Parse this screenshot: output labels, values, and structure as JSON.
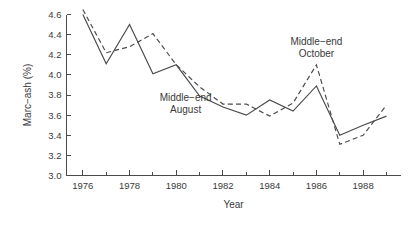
{
  "chart_data": {
    "type": "line",
    "title": "",
    "xlabel": "Year",
    "ylabel": "Marc−ash (%)",
    "xlim": [
      1975.3,
      1989.6
    ],
    "ylim": [
      3.0,
      4.6
    ],
    "grid": false,
    "legend_position": "inline-annotations",
    "x": [
      1976,
      1977,
      1978,
      1979,
      1980,
      1981,
      1982,
      1983,
      1984,
      1985,
      1986,
      1987,
      1988,
      1989
    ],
    "xticks_major": [
      1976,
      1978,
      1980,
      1982,
      1984,
      1986,
      1988
    ],
    "xticks_major_labels": [
      "1976",
      "1978",
      "1980",
      "1982",
      "1984",
      "1986",
      "1988"
    ],
    "xticks_minor": [
      1977,
      1979,
      1981,
      1983,
      1985,
      1987,
      1989
    ],
    "yticks": [
      3.0,
      3.2,
      3.4,
      3.6,
      3.8,
      4.0,
      4.2,
      4.4,
      4.6
    ],
    "ytick_labels": [
      "3.0",
      "3.2",
      "3.4",
      "3.6",
      "3.8",
      "4.0",
      "4.2",
      "4.4",
      "4.6"
    ],
    "series": [
      {
        "name": "Middle−end August",
        "style": "solid",
        "color": "#4a4a4a",
        "label_line1": "Middle−end",
        "label_line2": "August",
        "values": [
          4.6,
          4.11,
          4.5,
          4.01,
          4.1,
          3.79,
          3.68,
          3.6,
          3.75,
          3.64,
          3.89,
          3.4,
          3.5,
          3.59
        ]
      },
      {
        "name": "Middle−end October",
        "style": "dashed",
        "color": "#4a4a4a",
        "label_line1": "Middle−end",
        "label_line2": "October",
        "values": [
          4.65,
          4.22,
          4.28,
          4.41,
          4.1,
          3.88,
          3.71,
          3.71,
          3.59,
          3.72,
          4.1,
          3.31,
          3.4,
          3.7
        ]
      }
    ],
    "annotations": [
      {
        "name": "october-label",
        "line1": "Middle−end",
        "line2": "October",
        "x": 1986.0,
        "y": 4.3
      },
      {
        "name": "august-label",
        "line1": "Middle−end",
        "line2": "August",
        "x": 1980.4,
        "y": 3.74
      }
    ]
  }
}
